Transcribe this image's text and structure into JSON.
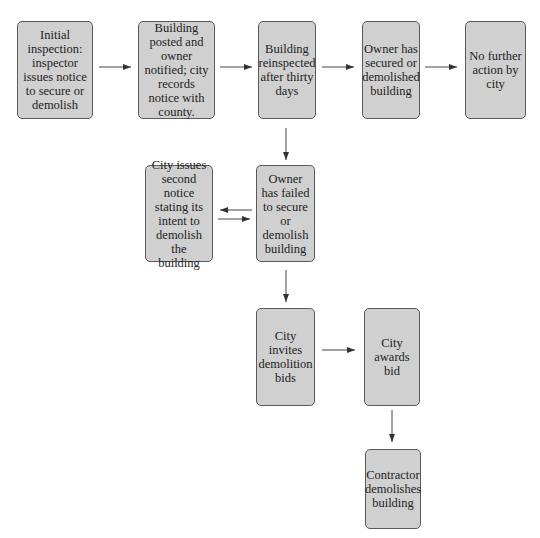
{
  "diagram": {
    "type": "flowchart",
    "nodes": [
      {
        "id": "n1",
        "label": "Initial inspection: inspector issues notice to secure or demolish"
      },
      {
        "id": "n2",
        "label": "Building posted and owner notified; city records notice with county."
      },
      {
        "id": "n3",
        "label": "Building reinspected after thirty days"
      },
      {
        "id": "n4",
        "label": "Owner has secured or demolished building"
      },
      {
        "id": "n5",
        "label": "No further action by city"
      },
      {
        "id": "n6",
        "label": "City issues second notice stating its intent to demolish the building"
      },
      {
        "id": "n7",
        "label": "Owner has failed to secure or demolish building"
      },
      {
        "id": "n8",
        "label": "City invites demolition bids"
      },
      {
        "id": "n9",
        "label": "City awards bid"
      },
      {
        "id": "n10",
        "label": "Contractor demolishes building"
      }
    ],
    "edges": [
      {
        "from": "n1",
        "to": "n2"
      },
      {
        "from": "n2",
        "to": "n3"
      },
      {
        "from": "n3",
        "to": "n4"
      },
      {
        "from": "n4",
        "to": "n5"
      },
      {
        "from": "n3",
        "to": "n7"
      },
      {
        "from": "n7",
        "to": "n6"
      },
      {
        "from": "n6",
        "to": "n7"
      },
      {
        "from": "n7",
        "to": "n8"
      },
      {
        "from": "n8",
        "to": "n9"
      },
      {
        "from": "n9",
        "to": "n10"
      }
    ]
  }
}
